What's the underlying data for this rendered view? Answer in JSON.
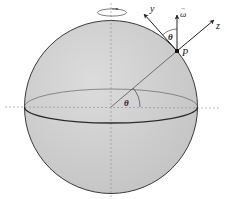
{
  "diagram": {
    "colors": {
      "sphere_fill": "#cfcfcf",
      "sphere_edge": "#3a3a3a",
      "axis_dash": "#8a8a8a",
      "arrow": "#222222",
      "background": "#ffffff"
    },
    "labels": {
      "y_axis": "y",
      "omega": "ω",
      "omega_vec": "→",
      "z_axis": "z",
      "theta_top": "θ",
      "point": "P",
      "theta_center": "θ"
    },
    "elements": [
      "sphere",
      "equator-ellipse",
      "vertical-dashed-axis",
      "horizontal-dashed-axis",
      "rotation-arrow",
      "radius-line",
      "point-P",
      "omega-arrow",
      "y-arrow",
      "z-arrow",
      "theta-arc-top",
      "theta-arc-center"
    ]
  }
}
